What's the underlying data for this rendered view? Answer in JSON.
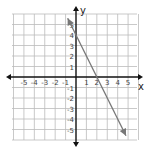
{
  "chart_data": {
    "type": "line",
    "title": "",
    "xlabel": "x",
    "ylabel": "y",
    "xlim": [
      -6,
      6
    ],
    "ylim": [
      -6,
      6
    ],
    "grid": true,
    "x_ticks": [
      -5,
      -4,
      -3,
      -2,
      -1,
      1,
      2,
      3,
      4,
      5
    ],
    "y_ticks": [
      5,
      4,
      3,
      2,
      1,
      -1,
      -2,
      -3,
      -4,
      -5
    ],
    "series": [
      {
        "name": "line",
        "equation": "y = -2x + 4",
        "slope": -2,
        "y_intercept": 4,
        "x_intercept": 2,
        "x": [
          -0.8,
          4.8
        ],
        "y": [
          5.6,
          -5.6
        ],
        "arrows": "both",
        "color": "#777777"
      }
    ]
  },
  "axes": {
    "x_label": "x",
    "y_label": "y",
    "color": "#111111"
  },
  "grid": {
    "color": "#bbbbbb"
  }
}
